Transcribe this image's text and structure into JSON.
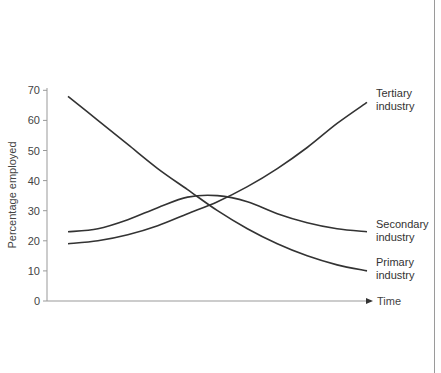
{
  "chart_data": {
    "type": "line",
    "title": "",
    "xlabel": "Time",
    "ylabel": "Percentage employed",
    "ylim": [
      0,
      70
    ],
    "yticks": [
      0,
      10,
      20,
      30,
      40,
      50,
      60,
      70
    ],
    "x": [
      0,
      1,
      2,
      3,
      4,
      5,
      6,
      7,
      8,
      9,
      10
    ],
    "grid": false,
    "legend_position": "inline-right",
    "series": [
      {
        "name": "Primary industry",
        "label_lines": [
          "Primary",
          "industry"
        ],
        "values": [
          68,
          60,
          52,
          44,
          37,
          30,
          24,
          19,
          15,
          12,
          10
        ]
      },
      {
        "name": "Secondary industry",
        "label_lines": [
          "Secondary",
          "industry"
        ],
        "values": [
          23,
          24,
          27,
          31,
          34.5,
          35,
          33,
          29,
          26,
          24,
          23
        ]
      },
      {
        "name": "Tertiary industry",
        "label_lines": [
          "Tertiary",
          "industry"
        ],
        "values": [
          19,
          20,
          22,
          25,
          29,
          33,
          38,
          44,
          51,
          59,
          66
        ]
      }
    ]
  },
  "colors": {
    "line": "#333333",
    "axis": "#999999",
    "border": "#9a9a9a"
  }
}
